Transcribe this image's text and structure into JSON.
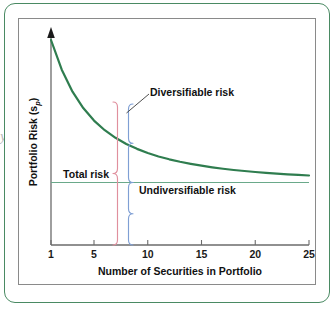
{
  "figure": {
    "border_color": "#4a8a63",
    "frame_color": "#8a8a8a",
    "background": "#ffffff",
    "edge_artifact": "y"
  },
  "chart_data": {
    "type": "line",
    "title": "",
    "xlabel": "Number of Securities in Portfolio",
    "ylabel": "Portfolio Risk (s",
    "ylabel_subscript": "p",
    "ylabel_suffix": ")",
    "xlim": [
      1,
      25
    ],
    "xticks": [
      1,
      5,
      10,
      15,
      20,
      25
    ],
    "xtick_labels": [
      "1",
      "5",
      "10",
      "15",
      "20",
      "25"
    ],
    "yticks": [],
    "ytick_labels": [],
    "grid": false,
    "legend": "none",
    "series": [
      {
        "name": "Portfolio risk curve",
        "color": "#2f7d4f",
        "x": [
          1,
          2,
          3,
          4,
          5,
          6,
          7,
          8,
          9,
          10,
          11,
          12,
          13,
          14,
          15,
          16,
          17,
          18,
          19,
          20,
          21,
          22,
          23,
          24,
          25
        ],
        "y": [
          1.0,
          0.855,
          0.748,
          0.668,
          0.607,
          0.56,
          0.523,
          0.493,
          0.469,
          0.449,
          0.432,
          0.418,
          0.406,
          0.396,
          0.387,
          0.379,
          0.372,
          0.366,
          0.361,
          0.356,
          0.352,
          0.348,
          0.345,
          0.342,
          0.339
        ]
      }
    ],
    "asymptote": {
      "name": "Undiversifiable risk level",
      "color": "#6aa98a",
      "y": 0.305,
      "x_start": 1,
      "x_end": 25
    },
    "annotations": [
      {
        "name": "diversifiable-risk",
        "text": "Diversifiable risk",
        "color": "#111111",
        "leader_color": "#3a3a3a"
      },
      {
        "name": "total-risk",
        "text": "Total risk",
        "color": "#111111",
        "brace_color": "#e0909e"
      },
      {
        "name": "undiversifiable-risk",
        "text": "Undiversifiable risk",
        "color": "#111111",
        "brace_color": "#7f9fd4"
      }
    ]
  }
}
